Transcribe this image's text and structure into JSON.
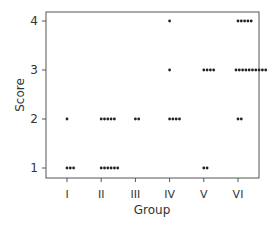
{
  "chart_data": {
    "type": "scatter",
    "subtype": "dot-strip",
    "title": "",
    "xlabel": "Group",
    "ylabel": "Score",
    "categories": [
      "I",
      "II",
      "III",
      "IV",
      "V",
      "VI"
    ],
    "yticks": [
      1,
      2,
      3,
      4
    ],
    "ylim": [
      0.8,
      4.2
    ],
    "grid": false,
    "legend": null,
    "points": [
      {
        "group": "I",
        "score": 1,
        "count": 3
      },
      {
        "group": "I",
        "score": 2,
        "count": 1
      },
      {
        "group": "II",
        "score": 1,
        "count": 6
      },
      {
        "group": "II",
        "score": 2,
        "count": 5
      },
      {
        "group": "III",
        "score": 2,
        "count": 2
      },
      {
        "group": "IV",
        "score": 2,
        "count": 4
      },
      {
        "group": "IV",
        "score": 3,
        "count": 1
      },
      {
        "group": "IV",
        "score": 4,
        "count": 1
      },
      {
        "group": "V",
        "score": 1,
        "count": 2
      },
      {
        "group": "V",
        "score": 3,
        "count": 4
      },
      {
        "group": "VI",
        "score": 2,
        "count": 2
      },
      {
        "group": "VI",
        "score": 3,
        "count": 10
      },
      {
        "group": "VI",
        "score": 4,
        "count": 5
      }
    ],
    "colors": {
      "dot": "#222222",
      "frame": "#555555",
      "text": "#333333"
    }
  }
}
